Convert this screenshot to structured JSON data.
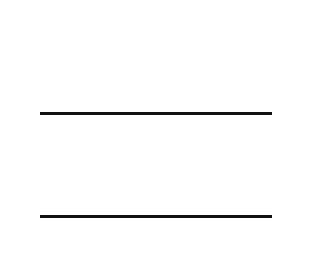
{
  "headers": {
    "whole": [
      "10,000",
      "1,000",
      "100",
      "10",
      "1"
    ],
    "fractions": [
      {
        "num": "1",
        "den": "10"
      },
      {
        "num": "1",
        "den": "100"
      },
      {
        "num": "1",
        "den": "1,000"
      },
      {
        "num": "1",
        "den": "10,000"
      }
    ]
  },
  "column_colors": {
    "whole": [
      "#8a8a8a",
      "#b8b8b8",
      "#8a8a8a",
      "#c4c4c4",
      "#f0f0f0"
    ],
    "fractions": [
      "#e2e2e2",
      "#e2e2e2",
      "#c4c4c4",
      "#f2f2f2"
    ]
  },
  "operator": "×",
  "rows": [
    {
      "name": "multiplicand",
      "digits": [
        "",
        "",
        "2",
        "2",
        "5"
      ]
    },
    {
      "name": "multiplier",
      "digits": [
        "",
        "",
        "1",
        "2",
        "3"
      ]
    },
    {
      "name": "partial-product-1",
      "digits": [
        "2",
        "2",
        "5",
        "0",
        "0"
      ]
    },
    {
      "name": "partial-product-2",
      "digits": [
        "",
        "4",
        "5",
        "0",
        "0"
      ]
    },
    {
      "name": "partial-product-3",
      "digits": [
        "",
        "",
        "6",
        "7",
        "5"
      ]
    },
    {
      "name": "product",
      "digits": [
        "2",
        "7",
        "6",
        "7",
        "5"
      ]
    }
  ]
}
